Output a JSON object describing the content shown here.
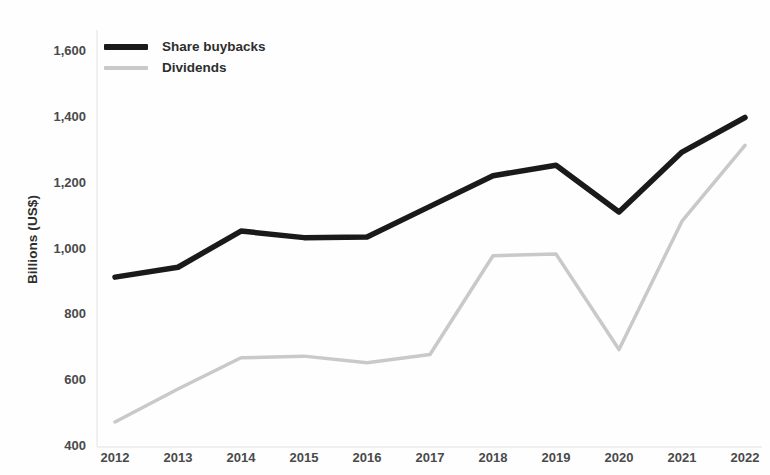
{
  "chart_data": {
    "type": "line",
    "title": "",
    "xlabel": "",
    "ylabel": "Billions (US$)",
    "categories": [
      "2012",
      "2013",
      "2014",
      "2015",
      "2016",
      "2017",
      "2018",
      "2019",
      "2020",
      "2021",
      "2022"
    ],
    "x": [
      2012,
      2013,
      2014,
      2015,
      2016,
      2017,
      2018,
      2019,
      2020,
      2021,
      2022
    ],
    "series": [
      {
        "name": "Share buybacks",
        "color": "#1a1a1a",
        "values": [
          910,
          940,
          1050,
          1030,
          1032,
          1125,
          1218,
          1250,
          1108,
          1290,
          1395
        ]
      },
      {
        "name": "Dividends",
        "color": "#c9c9c9",
        "values": [
          470,
          570,
          665,
          670,
          650,
          675,
          975,
          980,
          690,
          1080,
          1310
        ]
      }
    ],
    "ylim": [
      400,
      1600
    ],
    "ytick_values": [
      400,
      600,
      800,
      1000,
      1200,
      1400,
      1600
    ],
    "ytick_labels": [
      "400",
      "600",
      "800",
      "1,000",
      "1,200",
      "1,400",
      "1,600"
    ],
    "xlim": [
      2012,
      2022
    ],
    "grid": false,
    "legend_position": "top-left"
  },
  "legend": {
    "entries": [
      {
        "label": "Share buybacks",
        "swatch_name": "legend-swatch-share-buybacks"
      },
      {
        "label": "Dividends",
        "swatch_name": "legend-swatch-dividends"
      }
    ]
  },
  "axes": {
    "y_title": "Billions (US$)"
  }
}
